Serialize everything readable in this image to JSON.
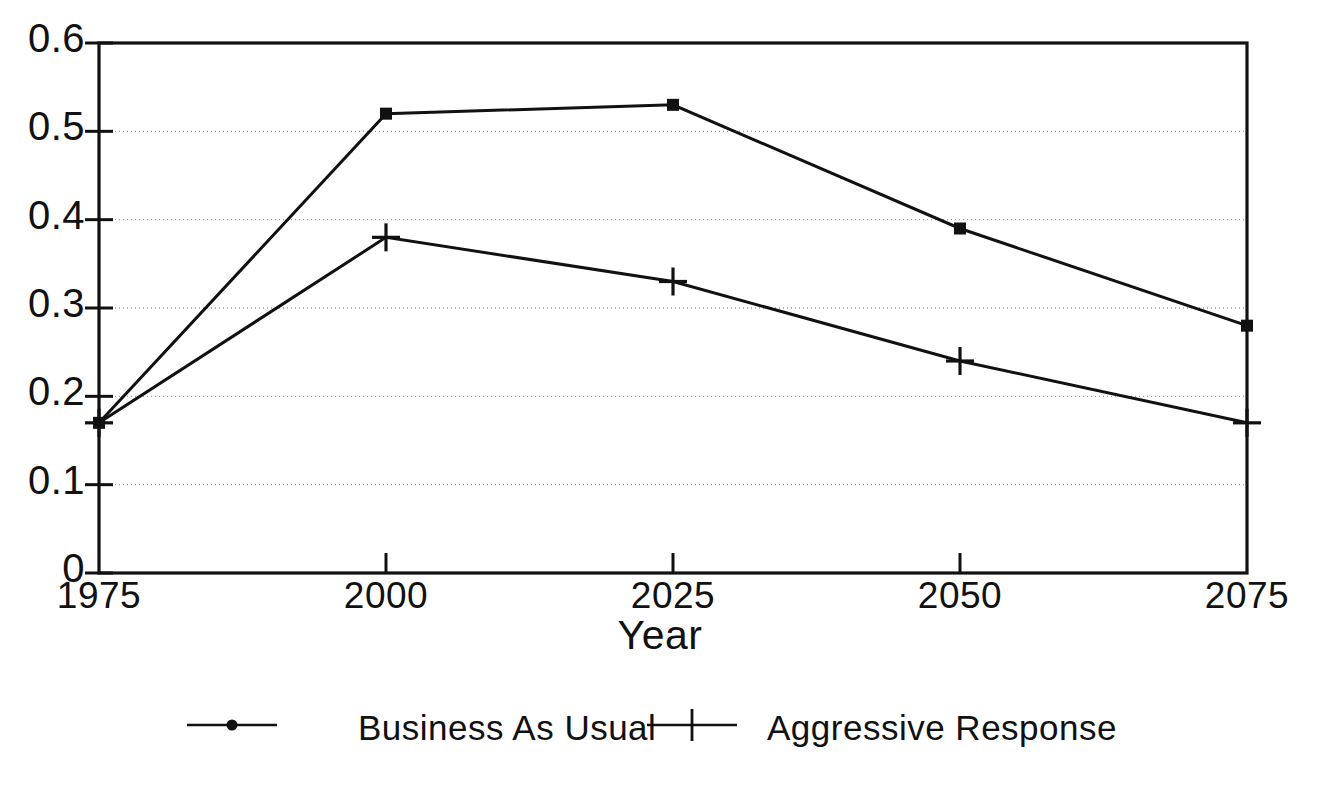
{
  "chart_data": {
    "type": "line",
    "title": "",
    "subtitle": "",
    "xlabel": "Year",
    "ylabel": "",
    "x": [
      1975,
      2000,
      2025,
      2050,
      2075
    ],
    "xtick_labels": [
      "1975",
      "2000",
      "2025",
      "2050",
      "2075"
    ],
    "ytick_labels": [
      "0",
      "0.1",
      "0.2",
      "0.3",
      "0.4",
      "0.5",
      "0.6"
    ],
    "ytick_values": [
      0,
      0.1,
      0.2,
      0.3,
      0.4,
      0.5,
      0.6
    ],
    "xlim": [
      1975,
      2075
    ],
    "ylim": [
      0,
      0.6
    ],
    "grid": "horizontal-dotted",
    "legend_position": "bottom-center",
    "line_color": "#111111",
    "grid_color": "#9a9a9a",
    "frame_color": "#111111",
    "series": [
      {
        "name": "Business As Usual",
        "marker": "square-dot",
        "values": [
          0.17,
          0.52,
          0.53,
          0.39,
          0.28
        ]
      },
      {
        "name": "Aggressive Response",
        "marker": "plus",
        "values": [
          0.17,
          0.38,
          0.33,
          0.24,
          0.17
        ]
      }
    ]
  },
  "legend": {
    "items": [
      {
        "label": "Business As Usual",
        "marker": "square-dot"
      },
      {
        "label": "Aggressive Response",
        "marker": "plus"
      }
    ]
  },
  "axes": {
    "x_title": "Year"
  }
}
